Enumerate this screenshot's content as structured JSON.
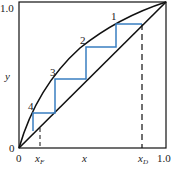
{
  "diagram": {
    "type": "McCabe-Thiele stage construction",
    "axes": {
      "x_label": "x",
      "y_label": "y",
      "x_ticks": [
        {
          "label": "0",
          "value": 0
        },
        {
          "label": "x_F",
          "value": 0.14
        },
        {
          "label": "x_D",
          "value": 0.84
        },
        {
          "label": "1.0",
          "value": 1.0
        }
      ],
      "y_ticks": [
        {
          "label": "0",
          "value": 0
        },
        {
          "label": "1.0",
          "value": 1.0
        }
      ]
    },
    "labels": {
      "x_axis": "x",
      "y_axis": "y",
      "origin_x": "0",
      "origin_y": "0",
      "x_max": "1.0",
      "y_max": "1.0",
      "xF_main": "x",
      "xF_sub": "F",
      "xD_main": "x",
      "xD_sub": "D"
    },
    "stages": [
      {
        "label": "1"
      },
      {
        "label": "2"
      },
      {
        "label": "3"
      },
      {
        "label": "4"
      }
    ],
    "colors": {
      "curve": "#111111",
      "steps": "#3a7fc1",
      "axes": "#111111"
    }
  }
}
